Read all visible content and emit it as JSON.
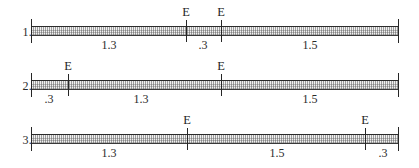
{
  "figure": {
    "type": "segment-bar-diagram",
    "bar_color": "#f1f1f1",
    "line_color": "#262626",
    "marker_label": "E"
  },
  "rows": [
    {
      "label": "1.",
      "bar_start": 31,
      "bar_end": 399,
      "ticks": [
        {
          "x": 186,
          "marker": "E"
        },
        {
          "x": 221,
          "marker": "E"
        }
      ],
      "segments": [
        {
          "value": "1.3",
          "center": 109
        },
        {
          "value": ".3",
          "center": 203
        },
        {
          "value": "1.5",
          "center": 310
        }
      ]
    },
    {
      "label": "2.",
      "bar_start": 31,
      "bar_end": 399,
      "ticks": [
        {
          "x": 68,
          "marker": "E"
        },
        {
          "x": 221,
          "marker": "E"
        }
      ],
      "segments": [
        {
          "value": ".3",
          "center": 49
        },
        {
          "value": "1.3",
          "center": 141
        },
        {
          "value": "1.5",
          "center": 310
        }
      ]
    },
    {
      "label": "3.",
      "bar_start": 31,
      "bar_end": 399,
      "ticks": [
        {
          "x": 187,
          "marker": "E"
        },
        {
          "x": 365,
          "marker": "E"
        }
      ],
      "segments": [
        {
          "value": "1.3",
          "center": 109
        },
        {
          "value": "1.5",
          "center": 277
        },
        {
          "value": ".3",
          "center": 383
        }
      ]
    }
  ]
}
